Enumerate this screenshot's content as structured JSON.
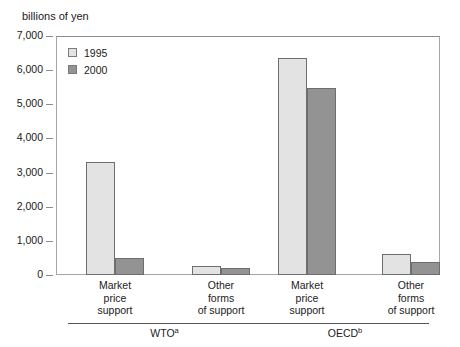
{
  "chart_data": {
    "type": "bar",
    "title": "",
    "subtitle": "",
    "unit_label": "billions of yen",
    "xlabel": "",
    "ylabel": "",
    "ylim": [
      0,
      7000
    ],
    "ytick_labels": [
      "7,000",
      "6,000",
      "5,000",
      "4,000",
      "3,000",
      "2,000",
      "1,000",
      "0"
    ],
    "ytick_values": [
      7000,
      6000,
      5000,
      4000,
      3000,
      2000,
      1000,
      0
    ],
    "grid": false,
    "legend_position": "top-left",
    "legend": [
      "1995",
      "2000"
    ],
    "groups": [
      {
        "name": "WTO",
        "footnote": "a",
        "categories": [
          "Market price support",
          "Other forms of support"
        ]
      },
      {
        "name": "OECD",
        "footnote": "b",
        "categories": [
          "Market price support",
          "Other forms of support"
        ]
      }
    ],
    "categories": [
      "WTO Market price support",
      "WTO Other forms of support",
      "OECD Market price support",
      "OECD Other forms of support"
    ],
    "series": [
      {
        "name": "1995",
        "color": "#e3e3e3",
        "values": [
          3300,
          250,
          6350,
          620
        ]
      },
      {
        "name": "2000",
        "color": "#939393",
        "values": [
          500,
          210,
          5480,
          380
        ]
      }
    ]
  },
  "category_lines": {
    "c0": [
      "Market",
      "price",
      "support"
    ],
    "c1": [
      "Other",
      "forms",
      "of support"
    ],
    "c2": [
      "Market",
      "price",
      "support"
    ],
    "c3": [
      "Other",
      "forms",
      "of support"
    ]
  },
  "group_labels": {
    "g0_name": "WTO",
    "g0_note": "a",
    "g1_name": "OECD",
    "g1_note": "b"
  },
  "y_ticks": {
    "t0": "7,000",
    "t1": "6,000",
    "t2": "5,000",
    "t3": "4,000",
    "t4": "3,000",
    "t5": "2,000",
    "t6": "1,000",
    "t7": "0"
  },
  "legend_labels": {
    "l0": "1995",
    "l1": "2000"
  }
}
